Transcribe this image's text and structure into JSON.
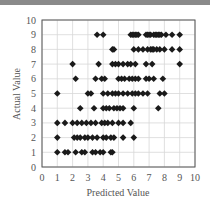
{
  "chart_data": {
    "type": "scatter",
    "title": "",
    "xlabel": "Predicted Value",
    "ylabel": "Actual Value",
    "xlim": [
      0,
      10
    ],
    "ylim": [
      0,
      10
    ],
    "xticks": [
      0,
      1,
      2,
      3,
      4,
      5,
      6,
      7,
      8,
      9,
      10
    ],
    "yticks": [
      0,
      1,
      2,
      3,
      4,
      5,
      6,
      7,
      8,
      9,
      10
    ],
    "grid": true,
    "legend": null,
    "marker": "diamond",
    "marker_color": "#1a1a1a",
    "rows": [
      {
        "y": 9,
        "x": [
          3.6,
          4.0,
          5.8,
          5.9,
          6.0,
          6.1,
          6.2,
          6.3,
          6.8,
          6.9,
          7.0,
          7.1,
          7.3,
          7.4,
          7.5,
          7.6,
          7.7,
          7.8,
          8.1,
          8.5,
          9.0
        ]
      },
      {
        "y": 8,
        "x": [
          4.6,
          4.7,
          6.0,
          6.3,
          6.6,
          6.9,
          7.1,
          7.2,
          7.3,
          7.5,
          7.7,
          8.0,
          8.5,
          9.0
        ]
      },
      {
        "y": 7,
        "x": [
          2.0,
          3.7,
          4.6,
          4.8,
          5.0,
          5.3,
          5.6,
          5.8,
          6.1,
          6.8,
          7.2,
          9.0
        ]
      },
      {
        "y": 6,
        "x": [
          2.2,
          3.5,
          3.9,
          4.1,
          5.0,
          5.2,
          5.4,
          5.7,
          5.9,
          6.1,
          6.3,
          6.8,
          7.0,
          7.3,
          7.9
        ]
      },
      {
        "y": 5,
        "x": [
          1.0,
          3.0,
          3.2,
          4.0,
          4.3,
          4.6,
          4.8,
          5.0,
          5.3,
          5.6,
          5.9,
          6.1,
          6.3,
          6.6,
          6.9,
          7.7,
          8.0
        ]
      },
      {
        "y": 4,
        "x": [
          2.5,
          3.4,
          4.0,
          4.2,
          4.4,
          4.7,
          4.9,
          5.1,
          5.3,
          6.0,
          7.6
        ]
      },
      {
        "y": 3,
        "x": [
          1.0,
          1.5,
          2.0,
          2.3,
          2.6,
          2.9,
          3.2,
          3.5,
          3.9,
          4.1,
          4.3,
          4.6,
          5.0,
          5.3,
          5.8
        ]
      },
      {
        "y": 2,
        "x": [
          1.0,
          2.1,
          2.3,
          2.5,
          2.8,
          3.0,
          3.3,
          3.6,
          4.0,
          4.2,
          4.5,
          4.7,
          5.3,
          6.0
        ]
      },
      {
        "y": 1,
        "x": [
          1.0,
          1.5,
          1.7,
          2.2,
          2.6,
          2.8,
          3.3,
          3.5,
          3.8,
          4.0,
          4.5,
          4.6
        ]
      }
    ]
  }
}
